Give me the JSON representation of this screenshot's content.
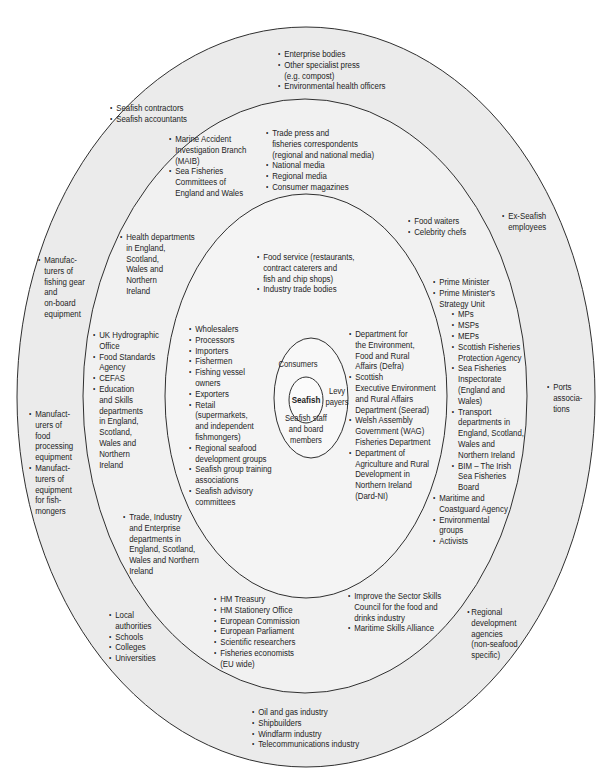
{
  "colors": {
    "outer_ring": "#ebebeb",
    "second_ring": "#f1f1f1",
    "third_ring": "#f4f4f4",
    "core_ring": "#f8f8f8",
    "seafish_core": "#fbfbfb",
    "stroke": "#2f2f2f",
    "text": "#1e1e1e"
  },
  "bullet": "•",
  "center": {
    "core_label": "Seafish",
    "consumers_label": "Consumers",
    "levy_label": "Levy\npayers",
    "staff_label": "Seafish staff\nand board\nmembers"
  },
  "rings": {
    "outer": {
      "top": {
        "items": [
          "Enterprise bodies",
          "Other specialist press\n(e.g. compost)",
          "Environmental health officers"
        ]
      },
      "top_left": {
        "items": [
          "Seafish contractors",
          "Seafish accountants"
        ]
      },
      "right_top": {
        "items": [
          "Ex-Seafish\nemployees"
        ]
      },
      "left_upper": {
        "items": [
          "Manufac-\nturers of\nfishing gear\nand\non-board\nequipment"
        ]
      },
      "right_middle": {
        "items": [
          "Ports\nassocia-\ntions"
        ]
      },
      "left_lower": {
        "items": [
          "Manufact-\nurers of\nfood\nprocessing\nequipment",
          "Manufact-\nturers of\nequipment\nfor fish-\nmongers"
        ]
      },
      "bottom_left": {
        "items": [
          "Local\nauthorities",
          "Schools",
          "Colleges",
          "Universities"
        ]
      },
      "bottom_right": {
        "items": [
          "Regional\ndevelopment\nagencies\n(non-seafood\nspecific)"
        ]
      },
      "bottom": {
        "items": [
          "Oil and gas industry",
          "Shipbuilders",
          "Windfarm industry",
          "Telecommunications industry"
        ]
      }
    },
    "second": {
      "top_left": {
        "items": [
          "Marine Accident\nInvestigation Branch\n(MAIB)",
          "Sea Fisheries\nCommittees of\nEngland and Wales"
        ]
      },
      "top_right": {
        "items": [
          "Trade press and\nfisheries correspondents\n(regional and national media)",
          "National media",
          "Regional media",
          "Consumer magazines"
        ]
      },
      "right_top": {
        "items": [
          "Food waiters",
          "Celebrity chefs"
        ]
      },
      "left_top": {
        "items": [
          "Health departments\nin England,\nScotland,\nWales and\nNorthern\nIreland"
        ]
      },
      "right": {
        "main_items": [
          "Prime Minister",
          "Prime Minister's\nStrategy Unit"
        ],
        "sub_items": [
          "MPs",
          "MSPs",
          "MEPs",
          "Scottish Fisheries\nProtection Agency",
          "Sea Fisheries\nInspectorate\n(England and\nWales)",
          "Transport\ndepartments in\nEngland, Scotland,\nWales and\nNorthern Ireland",
          "BIM – The Irish\nSea Fisheries\nBoard"
        ],
        "tail_items": [
          "Maritime and\nCoastguard Agency",
          "Environmental\ngroups",
          "Activists"
        ]
      },
      "left": {
        "items": [
          "UK Hydrographic\nOffice",
          "Food Standards\nAgency",
          "CEFAS",
          "Education\nand Skills\ndepartments\nin England,\nScotland,\nWales and\nNorthern\nIreland"
        ]
      },
      "left_bottom": {
        "items": [
          "Trade, Industry\nand Enterprise\ndepartments in\nEngland, Scotland,\nWales and Northern\nIreland"
        ]
      },
      "bottom_left": {
        "items": [
          "HM Treasury",
          "HM Stationery Office",
          "European Commission",
          "European Parliament",
          "Scientific researchers",
          "Fisheries economists\n(EU wide)"
        ]
      },
      "bottom_right": {
        "items": [
          "Improve the Sector Skills\nCouncil for the food and\ndrinks industry",
          "Maritime Skills Alliance"
        ]
      }
    },
    "third": {
      "top": {
        "items": [
          "Food service (restaurants,\ncontract caterers and\nfish and chip shops)",
          "Industry trade bodies"
        ]
      },
      "left": {
        "items": [
          "Wholesalers",
          "Processors",
          "Importers",
          "Fishermen",
          "Fishing vessel\nowners",
          "Exporters",
          "Retail\n(supermarkets,\nand independent\nfishmongers)",
          "Regional seafood\ndevelopment groups",
          "Seafish group training\nassociations",
          "Seafish advisory\ncommittees"
        ]
      },
      "right": {
        "items": [
          "Department for\nthe Environment,\nFood and Rural\nAffairs (Defra)",
          "Scottish\nExecutive Environment\nand Rural Affairs\nDepartment (Seerad)",
          "Welsh Assembly\nGovernment (WAG)\nFisheries Department",
          "Department of\nAgriculture and Rural\nDevelopment in\nNorthern Ireland\n(Dard-NI)"
        ]
      }
    }
  }
}
